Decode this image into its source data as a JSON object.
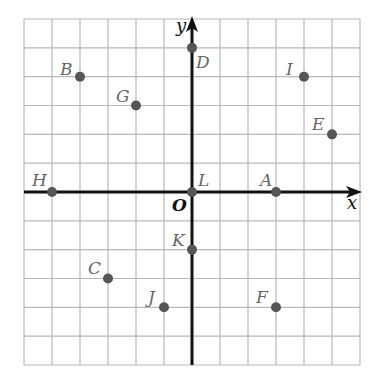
{
  "diagram": {
    "type": "coordinate-plane",
    "grid": {
      "x_min": -6,
      "x_max": 6,
      "y_min": -6,
      "y_max": 6,
      "step": 1
    },
    "axes": {
      "x_label": "x",
      "y_label": "y",
      "origin_label": "O"
    },
    "colors": {
      "grid": "#b8b8b8",
      "axis": "#111111",
      "point": "#555555",
      "label": "#666666"
    },
    "points": [
      {
        "name": "A",
        "x": 3,
        "y": 0
      },
      {
        "name": "B",
        "x": -4,
        "y": 4
      },
      {
        "name": "C",
        "x": -3,
        "y": -3
      },
      {
        "name": "D",
        "x": 0,
        "y": 5
      },
      {
        "name": "E",
        "x": 5,
        "y": 2
      },
      {
        "name": "F",
        "x": 3,
        "y": -4
      },
      {
        "name": "G",
        "x": -2,
        "y": 3
      },
      {
        "name": "H",
        "x": -5,
        "y": 0
      },
      {
        "name": "I",
        "x": 4,
        "y": 4
      },
      {
        "name": "J",
        "x": -1,
        "y": -4
      },
      {
        "name": "K",
        "x": 0,
        "y": -2
      },
      {
        "name": "L",
        "x": 0,
        "y": 0
      }
    ]
  }
}
